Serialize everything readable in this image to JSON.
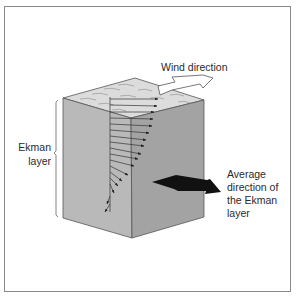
{
  "diagram": {
    "labels": {
      "wind": "Wind direction",
      "ekman_line1": "Ekman",
      "ekman_line2": "layer",
      "average_line1": "Average",
      "average_line2": "direction of",
      "average_line3": "the Ekman",
      "average_line4": "layer"
    },
    "colors": {
      "top_face": "#dcdcdc",
      "left_face": "#b9b9b9",
      "right_face": "#a3a3a3",
      "edge": "#555555",
      "frame": "#8a8a8a",
      "average_arrow": "#111111",
      "wind_arrow_fill": "#ffffff"
    },
    "current_vectors_count": 17
  }
}
